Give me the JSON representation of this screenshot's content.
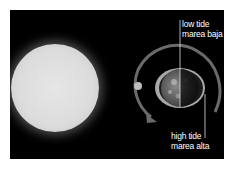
{
  "diagram": {
    "title": "",
    "background_color": "#000000",
    "elements": {
      "sun": {
        "label": "",
        "color": "#e0e0e0"
      },
      "moon": {
        "label": "",
        "color": "#bdbdbd"
      },
      "earth": {
        "label": "",
        "bulge_color": "#b0b0b0"
      },
      "orbit": {
        "color": "#6a6a6a",
        "direction": "counter-clockwise"
      }
    },
    "labels": {
      "low_tide": {
        "en": "low tide",
        "es": "marea baja"
      },
      "high_tide": {
        "en": "high tide",
        "es": "marea alta"
      }
    }
  }
}
